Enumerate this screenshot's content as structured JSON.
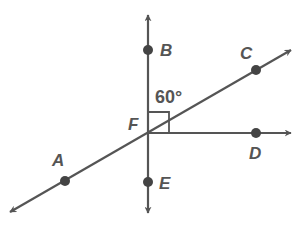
{
  "diagram": {
    "type": "geometry-lines-and-angles",
    "colors": {
      "line": "#555555",
      "point": "#444444",
      "background": "#ffffff"
    },
    "points": {
      "A": {
        "label": "A",
        "x": 65,
        "y": 181
      },
      "B": {
        "label": "B",
        "x": 148,
        "y": 50
      },
      "C": {
        "label": "C",
        "x": 256,
        "y": 70
      },
      "D": {
        "label": "D",
        "x": 256,
        "y": 133
      },
      "E": {
        "label": "E",
        "x": 148,
        "y": 182
      },
      "F": {
        "label": "F",
        "x": 148,
        "y": 133
      }
    },
    "lines": [
      {
        "name": "line-BE",
        "through": [
          "B",
          "F",
          "E"
        ],
        "arrows": "both"
      },
      {
        "name": "line-AC",
        "through": [
          "A",
          "F",
          "C"
        ],
        "arrows": "both"
      },
      {
        "name": "ray-FD",
        "through": [
          "F",
          "D"
        ],
        "arrows": "end"
      }
    ],
    "angle_label": "60°",
    "right_angle_marker": {
      "vertex": "F",
      "between": [
        "B",
        "D"
      ]
    }
  }
}
